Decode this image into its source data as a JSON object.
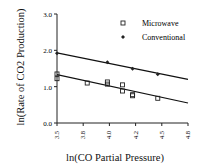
{
  "chart_data": {
    "type": "scatter",
    "title": "",
    "xlabel": "ln(CO Partial Pressure)",
    "ylabel": "ln(Rate of CO2 Production)",
    "xlim": [
      3.5,
      4.8
    ],
    "ylim": [
      0.0,
      3.0
    ],
    "x_ticks": [
      "3.5",
      "3.8",
      "4.0",
      "4.2",
      "4.5",
      "4.8"
    ],
    "y_ticks": [
      "0.0",
      "1.0",
      "2.0",
      "3.0"
    ],
    "grid": false,
    "legend_position": "upper right",
    "series": [
      {
        "name": "Microwave",
        "marker": "square-open",
        "points": [
          [
            3.5,
            1.35
          ],
          [
            3.5,
            1.22
          ],
          [
            3.8,
            1.1
          ],
          [
            4.0,
            1.13
          ],
          [
            4.0,
            1.07
          ],
          [
            4.15,
            1.05
          ],
          [
            4.15,
            0.88
          ],
          [
            4.25,
            0.78
          ],
          [
            4.25,
            0.75
          ],
          [
            4.5,
            0.68
          ]
        ],
        "fit_line": [
          [
            3.5,
            1.33
          ],
          [
            4.8,
            0.55
          ]
        ]
      },
      {
        "name": "Conventional",
        "marker": "diamond-filled",
        "points": [
          [
            3.5,
            1.92
          ],
          [
            4.0,
            1.67
          ],
          [
            4.25,
            1.49
          ],
          [
            4.5,
            1.34
          ]
        ],
        "fit_line": [
          [
            3.5,
            1.93
          ],
          [
            4.8,
            1.2
          ]
        ]
      }
    ]
  }
}
